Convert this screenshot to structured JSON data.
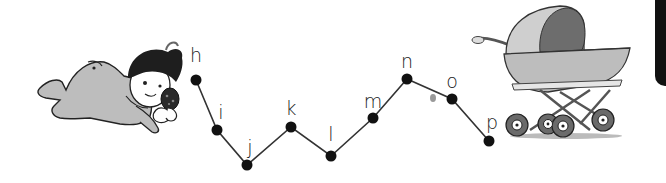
{
  "worksheet": {
    "task": "connect-the-dots alphabet h to p",
    "dots": [
      {
        "letter": "h",
        "x": 196,
        "y": 80,
        "label_x": 196,
        "label_y": 46
      },
      {
        "letter": "i",
        "x": 217,
        "y": 130,
        "label_x": 221,
        "label_y": 103
      },
      {
        "letter": "j",
        "x": 247,
        "y": 165,
        "label_x": 250,
        "label_y": 138
      },
      {
        "letter": "k",
        "x": 291,
        "y": 127,
        "label_x": 291,
        "label_y": 99
      },
      {
        "letter": "l",
        "x": 331,
        "y": 156,
        "label_x": 331,
        "label_y": 125
      },
      {
        "letter": "m",
        "x": 373,
        "y": 118,
        "label_x": 373,
        "label_y": 92
      },
      {
        "letter": "n",
        "x": 407,
        "y": 79,
        "label_x": 407,
        "label_y": 52
      },
      {
        "letter": "o",
        "x": 452,
        "y": 99,
        "label_x": 452,
        "label_y": 72
      },
      {
        "letter": "p",
        "x": 489,
        "y": 141,
        "label_x": 492,
        "label_y": 113
      }
    ],
    "colors": {
      "dot": "#111111",
      "line": "#333333",
      "text": "#1a1a1a",
      "tab": "#111111"
    },
    "illustrations": {
      "left": "crawling-baby-with-rattle",
      "right": "baby-pram"
    }
  }
}
